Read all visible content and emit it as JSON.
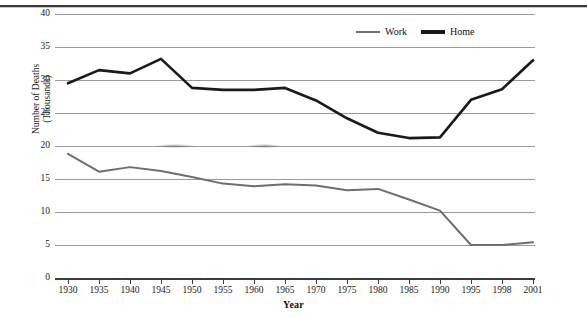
{
  "chart_data": {
    "type": "line",
    "title": "",
    "xlabel": "Year",
    "ylabel": "Number of Deaths\n(Thousands)",
    "ylabel_line1": "Number of Deaths",
    "ylabel_line2": "(Thousands)",
    "categories": [
      "1930",
      "1935",
      "1940",
      "1945",
      "1950",
      "1955",
      "1960",
      "1965",
      "1970",
      "1975",
      "1980",
      "1985",
      "1990",
      "1995",
      "1998",
      "2001"
    ],
    "x_ticks": [
      "1930",
      "1935",
      "1940",
      "1945",
      "1950",
      "1955",
      "1960",
      "1965",
      "1970",
      "1975",
      "1980",
      "1985",
      "1990",
      "1995",
      "1998",
      "2001"
    ],
    "y_ticks": [
      0,
      5,
      10,
      15,
      20,
      25,
      30,
      35,
      40
    ],
    "ylim": [
      0,
      40
    ],
    "grid": true,
    "legend_position": "top-right",
    "series": [
      {
        "name": "Work",
        "color": "#6e6e6e",
        "values": [
          18.8,
          16.1,
          16.8,
          16.2,
          15.3,
          14.3,
          13.9,
          14.2,
          14.0,
          13.3,
          13.5,
          11.9,
          10.2,
          5.0,
          5.0,
          5.4
        ]
      },
      {
        "name": "Home",
        "color": "#1a1a1a",
        "values": [
          29.5,
          31.5,
          31.0,
          33.2,
          28.8,
          28.5,
          28.5,
          28.8,
          26.9,
          24.2,
          22.0,
          21.2,
          21.3,
          27.0,
          28.6,
          33.0
        ]
      }
    ]
  },
  "legend": {
    "items": [
      {
        "label": "Work",
        "color": "#6e6e6e"
      },
      {
        "label": "Home",
        "color": "#1a1a1a"
      }
    ]
  }
}
